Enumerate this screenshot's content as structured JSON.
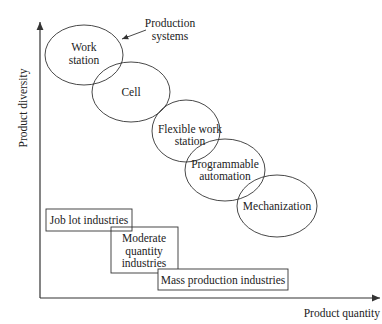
{
  "axes": {
    "y_label": "Product diversity",
    "x_label": "Product quantity"
  },
  "annotation": {
    "line1": "Production",
    "line2": "systems"
  },
  "production_systems": [
    {
      "line1": "Work",
      "line2": "station"
    },
    {
      "line1": "Cell"
    },
    {
      "line1": "Flexible work",
      "line2": "station"
    },
    {
      "line1": "Programmable",
      "line2": "automation"
    },
    {
      "line1": "Mechanization"
    }
  ],
  "industries": [
    {
      "line1": "Job lot industries"
    },
    {
      "line1": "Moderate",
      "line2": "quantity",
      "line3": "industries"
    },
    {
      "line1": "Mass production industries"
    }
  ],
  "colors": {
    "stroke": "#333333",
    "text": "#222222",
    "background": "#ffffff"
  }
}
